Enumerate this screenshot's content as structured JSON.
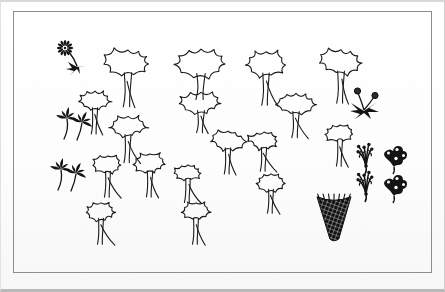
{
  "document": {
    "kind": "scanned-illustration",
    "title": "Hand-drawn landscape plan symbols",
    "background_color": "#fdfdfd",
    "ink_color": "#1a1a1a",
    "frame_color": "#8d8d8d",
    "width": 445,
    "height": 292
  },
  "frame": {
    "x": 13,
    "y": 11,
    "width": 419,
    "height": 262,
    "stroke_width": 1
  },
  "legend": {
    "tree_label": "tree-symbol",
    "shrub_label": "shrub-symbol",
    "flower_label": "flower-symbol",
    "grass_label": "grass-tuft-symbol"
  },
  "chart_data": {
    "type": "scatter",
    "title": "Hand-drawn landscape plan symbols",
    "xlabel": "",
    "ylabel": "",
    "xlim": [
      0,
      445
    ],
    "ylim": [
      0,
      292
    ],
    "grid": false,
    "legend": "none",
    "series": [
      {
        "name": "trees",
        "note": "cloud canopy on tapered trunk with splayed roots",
        "values": [
          {
            "id": "tree-1",
            "x": 128,
            "y": 62,
            "canopy_w": 46,
            "canopy_h": 30,
            "trunk_h": 34,
            "roots": 3,
            "scale": 1.0
          },
          {
            "id": "tree-2",
            "x": 201,
            "y": 62,
            "canopy_w": 52,
            "canopy_h": 32,
            "trunk_h": 26,
            "roots": 2,
            "scale": 1.1
          },
          {
            "id": "tree-3",
            "x": 201,
            "y": 102,
            "canopy_w": 42,
            "canopy_h": 24,
            "trunk_h": 22,
            "roots": 3,
            "scale": 0.92
          },
          {
            "id": "tree-4",
            "x": 266,
            "y": 63,
            "canopy_w": 40,
            "canopy_h": 28,
            "trunk_h": 32,
            "roots": 3,
            "scale": 0.95
          },
          {
            "id": "tree-5",
            "x": 341,
            "y": 61,
            "canopy_w": 42,
            "canopy_h": 28,
            "trunk_h": 32,
            "roots": 3,
            "scale": 0.98
          },
          {
            "id": "tree-6",
            "x": 296,
            "y": 103,
            "canopy_w": 40,
            "canopy_h": 24,
            "trunk_h": 26,
            "roots": 3,
            "scale": 0.92
          },
          {
            "id": "tree-7",
            "x": 95,
            "y": 100,
            "canopy_w": 32,
            "canopy_h": 22,
            "trunk_h": 26,
            "roots": 3,
            "scale": 0.8
          },
          {
            "id": "tree-8",
            "x": 128,
            "y": 126,
            "canopy_w": 38,
            "canopy_h": 24,
            "trunk_h": 28,
            "roots": 3,
            "scale": 0.88
          },
          {
            "id": "tree-9",
            "x": 228,
            "y": 140,
            "canopy_w": 34,
            "canopy_h": 22,
            "trunk_h": 26,
            "roots": 3,
            "scale": 0.82
          },
          {
            "id": "tree-10",
            "x": 264,
            "y": 140,
            "canopy_w": 32,
            "canopy_h": 20,
            "trunk_h": 24,
            "roots": 3,
            "scale": 0.78
          },
          {
            "id": "tree-11",
            "x": 340,
            "y": 133,
            "canopy_w": 30,
            "canopy_h": 20,
            "trunk_h": 26,
            "roots": 3,
            "scale": 0.76
          },
          {
            "id": "tree-12",
            "x": 108,
            "y": 164,
            "canopy_w": 30,
            "canopy_h": 20,
            "trunk_h": 26,
            "roots": 3,
            "scale": 0.76
          },
          {
            "id": "tree-13",
            "x": 150,
            "y": 163,
            "canopy_w": 34,
            "canopy_h": 22,
            "trunk_h": 26,
            "roots": 3,
            "scale": 0.82
          },
          {
            "id": "tree-14",
            "x": 188,
            "y": 172,
            "canopy_w": 28,
            "canopy_h": 18,
            "trunk_h": 24,
            "roots": 3,
            "scale": 0.72
          },
          {
            "id": "tree-15",
            "x": 271,
            "y": 182,
            "canopy_w": 30,
            "canopy_h": 20,
            "trunk_h": 24,
            "roots": 3,
            "scale": 0.76
          },
          {
            "id": "tree-16",
            "x": 101,
            "y": 211,
            "canopy_w": 30,
            "canopy_h": 20,
            "trunk_h": 26,
            "roots": 3,
            "scale": 0.76
          },
          {
            "id": "tree-17",
            "x": 196,
            "y": 211,
            "canopy_w": 30,
            "canopy_h": 20,
            "trunk_h": 26,
            "roots": 3,
            "scale": 0.76
          }
        ]
      },
      {
        "name": "flowers",
        "note": "solid ink flower and leaf motifs",
        "values": [
          {
            "id": "daisy-1",
            "x": 71,
            "y": 56,
            "style": "daisy-with-arrow-leaves",
            "scale": 1.0
          },
          {
            "id": "leafspray-1",
            "x": 76,
            "y": 121,
            "style": "two-leaf-spray",
            "scale": 1.0
          },
          {
            "id": "leafspray-2",
            "x": 70,
            "y": 172,
            "style": "two-leaf-spray",
            "scale": 1.0
          },
          {
            "id": "budplant-1",
            "x": 364,
            "y": 100,
            "style": "two-bud-sprig",
            "scale": 1.0
          }
        ]
      },
      {
        "name": "ornamental-shrubs",
        "note": "filigree / solid ink shrub clusters, paired",
        "values": [
          {
            "id": "filigree-1",
            "x": 366,
            "y": 158,
            "style": "open-filigree",
            "scale": 1.0
          },
          {
            "id": "filigree-2",
            "x": 394,
            "y": 157,
            "style": "solid-filigree",
            "scale": 1.0
          },
          {
            "id": "filigree-3",
            "x": 366,
            "y": 186,
            "style": "open-filigree",
            "scale": 1.0
          },
          {
            "id": "filigree-4",
            "x": 394,
            "y": 186,
            "style": "solid-filigree",
            "scale": 1.0
          }
        ]
      },
      {
        "name": "grass-tufts",
        "note": "dark cross-hatched fan-shaped tuft",
        "values": [
          {
            "id": "tuft-1",
            "x": 334,
            "y": 217,
            "width": 34,
            "height": 44,
            "scale": 1.0
          }
        ]
      }
    ]
  }
}
